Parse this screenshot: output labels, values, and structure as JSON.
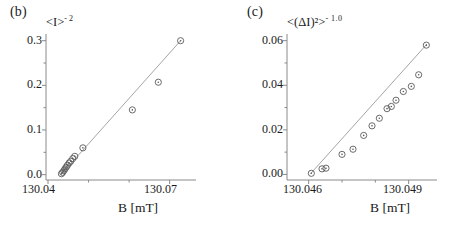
{
  "figure": {
    "background": "#ffffff",
    "axis_color": "#8a8a8a",
    "marker_color": "#5a5a5a",
    "line_color": "#9a9a9a",
    "text_color": "#1a1a1a"
  },
  "panels": [
    {
      "key": "b",
      "label": "(b)",
      "ylabel_main": "<I>",
      "ylabel_exp": "- 2",
      "xlabel": "B [mT]"
    },
    {
      "key": "c",
      "label": "(c)",
      "ylabel_main": "<(ΔI)²>",
      "ylabel_exp": "- 1.0",
      "xlabel": "B [mT]"
    }
  ],
  "chart_data": [
    {
      "type": "scatter",
      "panel": "b",
      "title": "(b)",
      "xlabel": "B [mT]",
      "ylabel": "<I>^-2",
      "xlim": [
        130.0395,
        130.0765
      ],
      "ylim": [
        -0.012,
        0.315
      ],
      "xticks": [
        130.04,
        130.07
      ],
      "xticklabels": [
        "130.04",
        "130.07"
      ],
      "xminor": [
        130.05,
        130.06
      ],
      "yticks": [
        0.0,
        0.1,
        0.2,
        0.3
      ],
      "yticklabels": [
        "0.0",
        "0.1",
        "0.2",
        "0.3"
      ],
      "yminor": [
        0.05,
        0.15,
        0.25
      ],
      "grid": false,
      "legend": null,
      "marker": "circle-dot",
      "fit_line": {
        "x": [
          130.0432,
          130.0727
        ],
        "y": [
          0.0,
          0.3
        ]
      },
      "x": [
        130.0433,
        130.0436,
        130.0439,
        130.0442,
        130.0445,
        130.0448,
        130.0452,
        130.0456,
        130.0461,
        130.0466,
        130.0486,
        130.0608,
        130.0672,
        130.0727
      ],
      "y": [
        0.002,
        0.005,
        0.009,
        0.013,
        0.017,
        0.021,
        0.026,
        0.03,
        0.036,
        0.041,
        0.06,
        0.145,
        0.207,
        0.3
      ]
    },
    {
      "type": "scatter",
      "panel": "c",
      "title": "(c)",
      "xlabel": "B [mT]",
      "ylabel": "<(ΔI)^2>^-1.0",
      "xlim": [
        130.04535,
        130.04985
      ],
      "ylim": [
        -0.0025,
        0.063
      ],
      "xticks": [
        130.046,
        130.049
      ],
      "xticklabels": [
        "130.046",
        "130.049"
      ],
      "xminor": [
        130.047,
        130.048
      ],
      "yticks": [
        0.0,
        0.02,
        0.04,
        0.06
      ],
      "yticklabels": [
        "0.00",
        "0.02",
        "0.04",
        "0.06"
      ],
      "yminor": [
        0.01,
        0.03,
        0.05
      ],
      "grid": false,
      "legend": null,
      "marker": "circle-dot",
      "fit_line": {
        "x": [
          130.04605,
          130.04955
        ],
        "y": [
          0.0002,
          0.0585
        ]
      },
      "x": [
        130.04608,
        130.0464,
        130.04652,
        130.047,
        130.04733,
        130.04765,
        130.0479,
        130.04812,
        130.04835,
        130.04848,
        130.04862,
        130.04884,
        130.04908,
        130.0493,
        130.04953
      ],
      "y": [
        0.0005,
        0.0025,
        0.0028,
        0.009,
        0.0113,
        0.0175,
        0.0218,
        0.0252,
        0.0295,
        0.0305,
        0.0333,
        0.0372,
        0.0395,
        0.0447,
        0.058
      ]
    }
  ]
}
